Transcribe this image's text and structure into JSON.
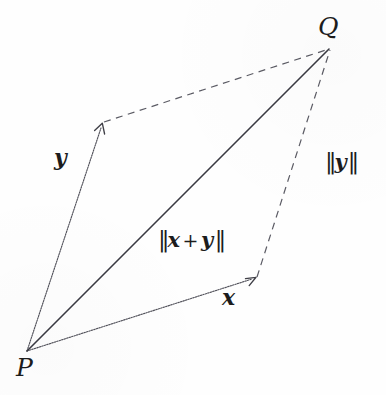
{
  "figure": {
    "background_color": "#fefefe",
    "stroke_color": "#4a4a52",
    "solid_stroke_color": "#3a3a42",
    "text_color": "#1c1c1c",
    "width": 386,
    "height": 395
  },
  "points": {
    "P": {
      "label": "P",
      "x": 27,
      "y": 351,
      "label_x": 16,
      "label_y": 355
    },
    "Q": {
      "label": "Q",
      "x": 330,
      "y": 48,
      "label_x": 318,
      "label_y": 14
    },
    "x_tip": {
      "label": "",
      "x": 256,
      "y": 278
    },
    "y_tip": {
      "label": "",
      "x": 102,
      "y": 124
    }
  },
  "labels": {
    "vector_x": {
      "text": "x",
      "x": 222,
      "y": 286
    },
    "vector_y": {
      "text": "y",
      "x": 54,
      "y": 146
    },
    "norm_y": {
      "bar_open": "‖",
      "vec": "y",
      "bar_close": "‖",
      "x": 324,
      "y": 150
    },
    "norm_xy": {
      "bar_open": "‖",
      "vec1": "x",
      "op": "+",
      "vec2": "y",
      "bar_close": "‖",
      "x": 157,
      "y": 228
    }
  },
  "segments": [
    {
      "name": "vector-x",
      "from": "P",
      "to": "x_tip",
      "style": "dotted",
      "arrow": true
    },
    {
      "name": "vector-y",
      "from": "P",
      "to": "y_tip",
      "style": "dotted",
      "arrow": true
    },
    {
      "name": "resultant-x-plus-y",
      "from": "P",
      "to": "Q",
      "style": "solid",
      "arrow": false
    },
    {
      "name": "parallel-y-from-x-tip",
      "from": "x_tip",
      "to": "Q",
      "style": "dashed",
      "arrow": false
    },
    {
      "name": "parallel-x-from-y-tip",
      "from": "y_tip",
      "to": "Q",
      "style": "dashed",
      "arrow": false
    }
  ]
}
